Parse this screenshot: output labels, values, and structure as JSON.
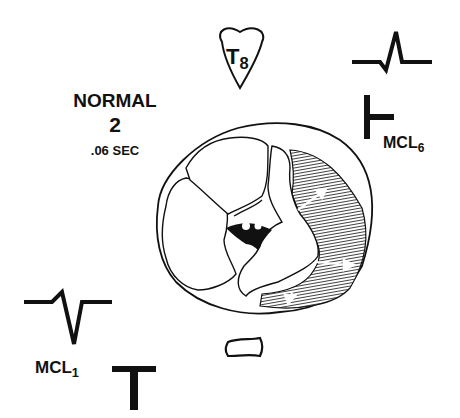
{
  "diagram": {
    "rhythm_label": "NORMAL",
    "rhythm_number": "2",
    "duration": ".06 SEC",
    "vertebra_label": {
      "letter": "T",
      "subscript": "8"
    },
    "leads": [
      {
        "name": "MCL",
        "subscript": "6",
        "qrs_shape": "small-q-tall-R",
        "t_vector": "left-pointing-T"
      },
      {
        "name": "MCL",
        "subscript": "1",
        "qrs_shape": "small-r-deep-S",
        "t_vector": "upright-T"
      }
    ],
    "structures": [
      "heart-cross-section",
      "left-ventricle-wall-hatched",
      "depolarization-arrows",
      "sternum",
      "vertebra-T8"
    ],
    "colors": {
      "ink": "#111111",
      "background": "#ffffff"
    }
  }
}
